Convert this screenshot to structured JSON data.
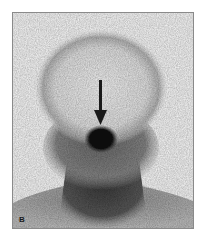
{
  "figure": {
    "panel_label": "B",
    "image_type": "scintigraphy scan",
    "annotation": "arrow pointing to focal uptake",
    "colors": {
      "background": "#ffffff",
      "frame_border": "#8a8a8a",
      "uptake_dark": "#141414",
      "activity_mid": "#6e6e6e",
      "activity_light": "#c8c8c8"
    }
  }
}
